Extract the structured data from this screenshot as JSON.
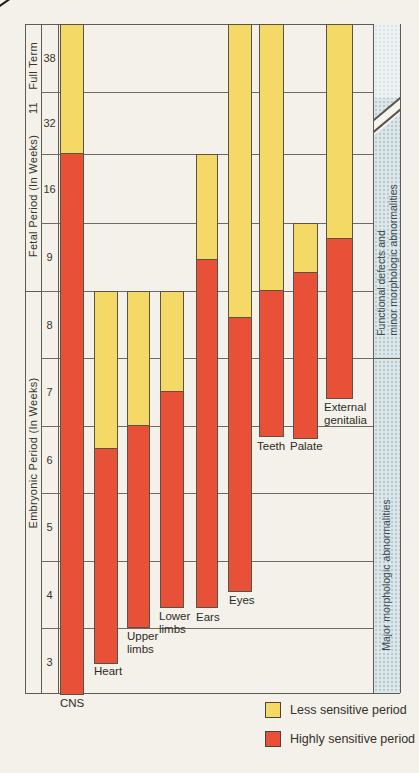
{
  "colors": {
    "highly_sensitive": "#e85038",
    "less_sensitive": "#f5d967",
    "strip_bg": "#dde7ea",
    "line": "#615c52",
    "text": "#38342c",
    "page_bg": "#f3f1ea"
  },
  "axes": {
    "full_term_label": "Full Term",
    "between_label": "11",
    "fetal_label": "Fetal Period (In Weeks)",
    "embryonic_label": "Embryonic Period (In Weeks)",
    "week_ticks": [
      "38",
      "32",
      "16",
      "9",
      "8",
      "7",
      "6",
      "5",
      "4",
      "3"
    ]
  },
  "right_strip": {
    "top_text_lines": [
      "Functional defects and",
      "minor morphologic abnormalities"
    ],
    "bottom_text": "Major morphologic abnormalities"
  },
  "legend": [
    {
      "swatch": "less_sensitive",
      "label": "Less sensitive period"
    },
    {
      "swatch": "highly_sensitive",
      "label": "Highly sensitive period"
    }
  ],
  "chart_data": {
    "type": "bar",
    "subtype": "critical-periods-gantt",
    "orientation": "vertical, weeks increase upward (3 at bottom, full term at top)",
    "legend_meaning": {
      "red": "Highly sensitive period",
      "yellow": "Less sensitive period"
    },
    "week_scale_stops": [
      [
        2,
        695
      ],
      [
        3,
        628
      ],
      [
        4,
        561
      ],
      [
        5,
        493
      ],
      [
        6,
        426
      ],
      [
        7,
        358
      ],
      [
        8,
        291
      ],
      [
        9,
        223
      ],
      [
        16,
        154
      ],
      [
        32,
        92
      ],
      [
        38,
        24
      ]
    ],
    "bars": [
      {
        "name": "CNS",
        "label_lines": [
          "CNS"
        ],
        "x": 60,
        "width": 24,
        "top_week": 38,
        "red_top_week": 16,
        "bottom_week": 2.0,
        "label_x": 60,
        "label_y": 697
      },
      {
        "name": "Heart",
        "label_lines": [
          "Heart"
        ],
        "x": 94,
        "width": 24,
        "top_week": 8,
        "red_top_week": 5.66,
        "bottom_week": 2.46,
        "label_x": 94,
        "label_y": 665
      },
      {
        "name": "Upper limbs",
        "label_lines": [
          "Upper",
          "limbs"
        ],
        "x": 127,
        "width": 23,
        "top_week": 8,
        "red_top_week": 6.0,
        "bottom_week": 3.0,
        "label_x": 127,
        "label_y": 630
      },
      {
        "name": "Lower limbs",
        "label_lines": [
          "Lower",
          "limbs"
        ],
        "x": 160,
        "width": 24,
        "top_week": 8,
        "red_top_week": 6.5,
        "bottom_week": 3.3,
        "label_x": 159,
        "label_y": 610
      },
      {
        "name": "Ears",
        "label_lines": [
          "Ears"
        ],
        "x": 196,
        "width": 22,
        "top_week": 16,
        "red_top_week": 8.46,
        "bottom_week": 3.3,
        "label_x": 196,
        "label_y": 611
      },
      {
        "name": "Eyes",
        "label_lines": [
          "Eyes"
        ],
        "x": 228,
        "width": 24,
        "top_week": 38,
        "red_top_week": 7.6,
        "bottom_week": 3.53,
        "label_x": 229,
        "label_y": 594
      },
      {
        "name": "Teeth",
        "label_lines": [
          "Teeth"
        ],
        "x": 259,
        "width": 25,
        "top_week": 38,
        "red_top_week": 8.0,
        "bottom_week": 5.84,
        "label_x": 257,
        "label_y": 440
      },
      {
        "name": "Palate",
        "label_lines": [
          "Palate"
        ],
        "x": 293,
        "width": 25,
        "top_week": 9,
        "red_top_week": 8.26,
        "bottom_week": 5.81,
        "label_x": 290,
        "label_y": 440
      },
      {
        "name": "External genitalia",
        "label_lines": [
          "External",
          "genitalia"
        ],
        "x": 326,
        "width": 27,
        "top_week": 38,
        "red_top_week": 8.76,
        "bottom_week": 6.39,
        "label_x": 324,
        "label_y": 401
      }
    ]
  }
}
